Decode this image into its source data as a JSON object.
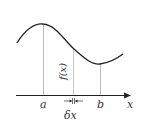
{
  "diagram": {
    "labels": {
      "a": "a",
      "b": "b",
      "x_axis": "x",
      "delta_x": "δx",
      "fx": "f(x)"
    },
    "colors": {
      "curve": "#222222",
      "axis": "#222222",
      "guide_lines": "#b0b0b0",
      "text": "#333333"
    }
  }
}
